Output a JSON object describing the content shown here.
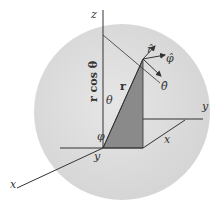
{
  "diagram": {
    "type": "spherical-coordinates",
    "colors": {
      "sphere": "#dcdcdc",
      "shaded_triangle": "#8a8a8a",
      "lines": "#333333",
      "background": "#ffffff"
    },
    "labels": {
      "z_axis": "z",
      "x_axis": "x",
      "y_axis": "y",
      "r_cos_theta": "r cos θ",
      "radius": "r",
      "theta": "θ",
      "phi": "φ",
      "r_hat": "r̂",
      "phi_hat": "φ̂",
      "theta_hat": "θ̂",
      "proj_y": "y",
      "proj_x": "x"
    }
  }
}
